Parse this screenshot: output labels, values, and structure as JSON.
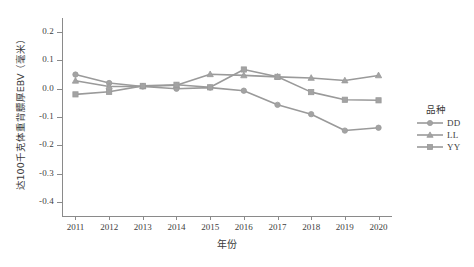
{
  "chart_data": {
    "type": "line",
    "title": "",
    "xlabel": "年份",
    "ylabel": "达100千克体重背膘厚EBV（毫米）",
    "x": [
      2011,
      2012,
      2013,
      2014,
      2015,
      2016,
      2017,
      2018,
      2019,
      2020
    ],
    "xtick_labels": [
      "2011",
      "2012",
      "2013",
      "2014",
      "2015",
      "2016",
      "2017",
      "2018",
      "2019",
      "2020"
    ],
    "ytick_labels": [
      "0.2",
      "0.1",
      "0.0",
      "-0.1",
      "-0.2",
      "-0.3",
      "-0.4"
    ],
    "ytick_values": [
      0.2,
      0.1,
      0.0,
      -0.1,
      -0.2,
      -0.3,
      -0.4
    ],
    "ylim": [
      -0.45,
      0.25
    ],
    "xlim": [
      2010.6,
      2020.4
    ],
    "grid": false,
    "legend_position": "right",
    "legend_title": "品种",
    "series": [
      {
        "name": "DD",
        "marker": "circle",
        "color": "#9a9a9a",
        "values": [
          0.05,
          0.02,
          0.008,
          0.0,
          0.004,
          -0.007,
          -0.057,
          -0.09,
          -0.148,
          -0.138
        ]
      },
      {
        "name": "LL",
        "marker": "triangle",
        "color": "#9a9a9a",
        "values": [
          0.028,
          0.008,
          0.008,
          0.012,
          0.051,
          0.047,
          0.042,
          0.038,
          0.029,
          0.047
        ]
      },
      {
        "name": "YY",
        "marker": "square",
        "color": "#9a9a9a",
        "values": [
          -0.02,
          -0.011,
          0.01,
          0.014,
          0.005,
          0.068,
          0.042,
          -0.012,
          -0.039,
          -0.041
        ]
      }
    ]
  },
  "legend": {
    "title": "品种",
    "items": [
      {
        "label": "DD",
        "marker": "circle-marker"
      },
      {
        "label": "LL",
        "marker": "triangle-marker"
      },
      {
        "label": "YY",
        "marker": "square-marker"
      }
    ]
  }
}
